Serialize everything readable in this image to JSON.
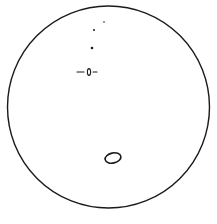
{
  "drawing": {
    "type": "eyepiece-field-sketch",
    "ink_color": "#1a1a1a",
    "background": "#ffffff",
    "field_circle": {
      "cx": 108.5,
      "cy": 107,
      "r": 101
    },
    "stars": [
      {
        "x": 104,
        "y": 22,
        "r": 0.8
      },
      {
        "x": 94,
        "y": 30,
        "r": 1.0
      },
      {
        "x": 92,
        "y": 48,
        "r": 1.3
      }
    ],
    "marked_object": {
      "x": 89,
      "y": 72,
      "rx": 1.6,
      "ry": 3.4,
      "left_tick": [
        77,
        84
      ],
      "right_tick": [
        93,
        97
      ]
    },
    "nebula_outline": {
      "cx": 113,
      "cy": 158,
      "rx": 8,
      "ry": 5,
      "rotate": -12
    }
  }
}
